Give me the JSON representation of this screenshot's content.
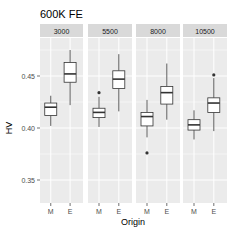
{
  "chart_data": {
    "type": "boxplot",
    "title": "600K FE",
    "xlabel": "Origin",
    "ylabel": "HV",
    "ylim": [
      0.335,
      0.495
    ],
    "yticks": [
      0.35,
      0.4,
      0.45
    ],
    "ytick_labels": [
      "0.35",
      "0.40",
      "0.45"
    ],
    "grid": true,
    "facet_by": "panel",
    "categories": [
      "M",
      "E"
    ],
    "panels": [
      {
        "label": "3000",
        "boxes": [
          {
            "category": "M",
            "lower_whisker": 0.402,
            "q1": 0.412,
            "median": 0.42,
            "q3": 0.424,
            "upper_whisker": 0.431,
            "outliers": []
          },
          {
            "category": "E",
            "lower_whisker": 0.422,
            "q1": 0.444,
            "median": 0.452,
            "q3": 0.463,
            "upper_whisker": 0.475,
            "outliers": []
          }
        ]
      },
      {
        "label": "5500",
        "boxes": [
          {
            "category": "M",
            "lower_whisker": 0.401,
            "q1": 0.41,
            "median": 0.415,
            "q3": 0.419,
            "upper_whisker": 0.43,
            "outliers": [
              0.434
            ]
          },
          {
            "category": "E",
            "lower_whisker": 0.416,
            "q1": 0.438,
            "median": 0.447,
            "q3": 0.455,
            "upper_whisker": 0.471,
            "outliers": []
          }
        ]
      },
      {
        "label": "8000",
        "boxes": [
          {
            "category": "M",
            "lower_whisker": 0.391,
            "q1": 0.402,
            "median": 0.411,
            "q3": 0.415,
            "upper_whisker": 0.427,
            "outliers": [
              0.376
            ]
          },
          {
            "category": "E",
            "lower_whisker": 0.408,
            "q1": 0.423,
            "median": 0.434,
            "q3": 0.44,
            "upper_whisker": 0.462,
            "outliers": []
          }
        ]
      },
      {
        "label": "10500",
        "boxes": [
          {
            "category": "M",
            "lower_whisker": 0.389,
            "q1": 0.398,
            "median": 0.403,
            "q3": 0.408,
            "upper_whisker": 0.417,
            "outliers": []
          },
          {
            "category": "E",
            "lower_whisker": 0.397,
            "q1": 0.415,
            "median": 0.424,
            "q3": 0.429,
            "upper_whisker": 0.448,
            "outliers": [
              0.451
            ]
          }
        ]
      }
    ]
  },
  "style": {
    "panel_bg": "#EBEBEB",
    "strip_bg": "#D9D9D9",
    "grid_color": "#FFFFFF",
    "box_fill": "#FFFFFF",
    "box_stroke": "#333333",
    "outlier_color": "#333333"
  }
}
